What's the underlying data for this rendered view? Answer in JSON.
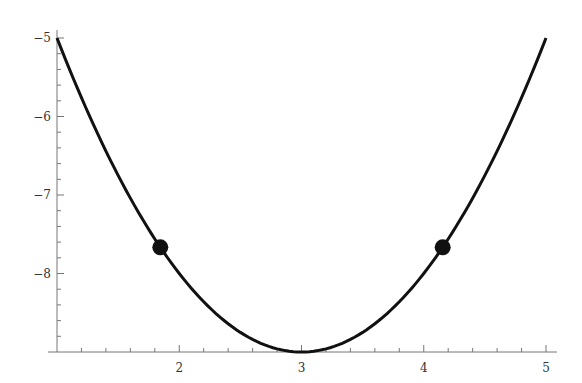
{
  "chart_data": {
    "type": "line",
    "title": "",
    "xlabel": "",
    "ylabel": "",
    "xlim": [
      1,
      5
    ],
    "ylim": [
      -9,
      -5
    ],
    "grid": false,
    "x_ticks": [
      2,
      3,
      4,
      5
    ],
    "x_tick_labels": [
      "2",
      "3",
      "4",
      "5"
    ],
    "y_ticks": [
      -5,
      -6,
      -7,
      -8
    ],
    "y_tick_labels": [
      "−5",
      "−6",
      "−7",
      "−8"
    ],
    "series": [
      {
        "name": "curve",
        "description": "parabola y = (x - 3)^2 - 9",
        "x": [
          1,
          1.5,
          2,
          2.5,
          3,
          3.5,
          4,
          4.5,
          5
        ],
        "values": [
          -5,
          -6.75,
          -8,
          -8.75,
          -9,
          -8.75,
          -8,
          -6.75,
          -5
        ],
        "color": "#111111"
      },
      {
        "name": "points",
        "type": "scatter",
        "x": [
          1.845,
          4.155
        ],
        "values": [
          -7.667,
          -7.667
        ],
        "color": "#111111"
      }
    ]
  }
}
